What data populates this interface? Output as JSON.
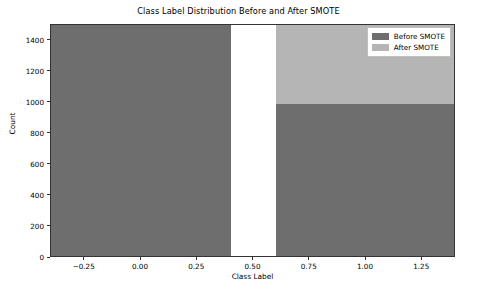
{
  "chart_data": {
    "type": "bar",
    "title": "Class Label Distribution Before and After SMOTE",
    "xlabel": "Class Label",
    "ylabel": "Count",
    "categories": [
      "0",
      "1"
    ],
    "x": [
      0,
      1
    ],
    "series": [
      {
        "name": "Before SMOTE",
        "color": "#6e6e6e",
        "values": [
          1490,
          980
        ]
      },
      {
        "name": "After SMOTE",
        "color": "#b5b5b5",
        "values": [
          1490,
          1490
        ]
      }
    ],
    "overlay": "stacked-overlap",
    "bar_width": 0.8,
    "xlim": [
      -0.4,
      1.4
    ],
    "ylim": [
      0,
      1500
    ],
    "yticks": [
      0,
      200,
      400,
      600,
      800,
      1000,
      1200,
      1400
    ],
    "ytick_labels": [
      "0",
      "200",
      "400",
      "600",
      "800",
      "1000",
      "1200",
      "1400"
    ],
    "xticks": [
      -0.25,
      0.0,
      0.25,
      0.5,
      0.75,
      1.0,
      1.25
    ],
    "xtick_labels": [
      "−0.25",
      "0.00",
      "0.25",
      "0.50",
      "0.75",
      "1.00",
      "1.25"
    ],
    "grid": false,
    "legend_position": "upper right"
  },
  "legend": {
    "entries": [
      {
        "label": "Before SMOTE",
        "color": "#6e6e6e"
      },
      {
        "label": "After SMOTE",
        "color": "#b5b5b5"
      }
    ]
  }
}
